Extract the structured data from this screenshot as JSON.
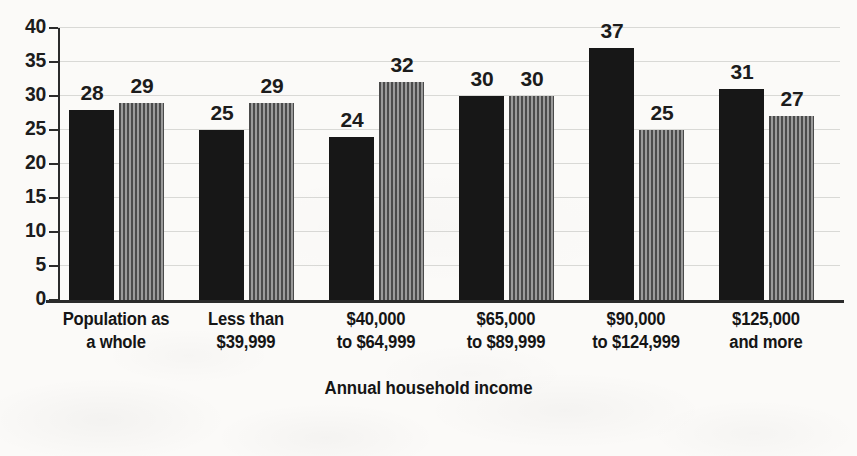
{
  "chart_data": {
    "type": "bar",
    "title": "",
    "xlabel": "Annual household income",
    "ylabel": "",
    "ylim": [
      0,
      40
    ],
    "yticks": [
      0,
      5,
      10,
      15,
      20,
      25,
      30,
      35,
      40
    ],
    "grid": true,
    "legend": "none",
    "categories": [
      "Population as a whole",
      "Less than $39,999",
      "$40,000 to $64,999",
      "$65,000 to $89,999",
      "$90,000 to $124,999",
      "$125,000 and more"
    ],
    "category_lines": [
      [
        "Population as",
        "a whole"
      ],
      [
        "Less than",
        "$39,999"
      ],
      [
        "$40,000",
        "to $64,999"
      ],
      [
        "$65,000",
        "to $89,999"
      ],
      [
        "$90,000",
        "to $124,999"
      ],
      [
        "$125,000",
        "and more"
      ]
    ],
    "series": [
      {
        "name": "series-1-solid",
        "style": "solid-black",
        "color": "#171717",
        "values": [
          28,
          25,
          24,
          30,
          37,
          31
        ]
      },
      {
        "name": "series-2-striped",
        "style": "vertical-stripes-gray",
        "color": "#6f6f6f",
        "values": [
          29,
          29,
          32,
          30,
          25,
          27
        ]
      }
    ]
  },
  "axis": {
    "title": "Annual household income",
    "ytick_labels": [
      "40",
      "35",
      "30",
      "25",
      "20",
      "15",
      "10",
      "5",
      "0"
    ]
  }
}
